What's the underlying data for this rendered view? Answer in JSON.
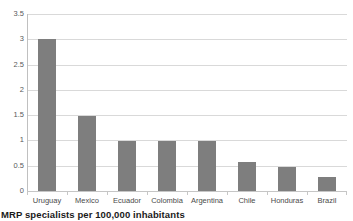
{
  "caption": "MRP specialists per 100,000 inhabitants",
  "colors": {
    "bar": "#7e7e7e",
    "gridline": "#d9d9d9",
    "axis": "#c0c0c0",
    "tick_label": "#58595b",
    "caption": "#1a1a1a",
    "background": "#ffffff"
  },
  "chart_data": {
    "type": "bar",
    "title": "",
    "subtitle": "",
    "xlabel": "",
    "ylabel": "",
    "categories": [
      "Uruguay",
      "Mexico",
      "Ecuador",
      "Colombia",
      "Argentina",
      "Chile",
      "Honduras",
      "Brazil"
    ],
    "values": [
      3.0,
      1.48,
      0.99,
      0.99,
      0.99,
      0.58,
      0.48,
      0.28
    ],
    "series": [
      {
        "name": "MRP specialists per 100,000 inhabitants",
        "values": [
          3.0,
          1.48,
          0.99,
          0.99,
          0.99,
          0.58,
          0.48,
          0.28
        ]
      }
    ],
    "ylim": [
      0,
      3.5
    ],
    "ytick_labels": [
      "0",
      "0.5",
      "1",
      "1.5",
      "2",
      "2.5",
      "3",
      "3.5"
    ],
    "ytick_values": [
      0,
      0.5,
      1,
      1.5,
      2,
      2.5,
      3,
      3.5
    ],
    "grid": true,
    "grid_axis": "y",
    "legend": false,
    "legend_position": "none",
    "annotations": []
  }
}
